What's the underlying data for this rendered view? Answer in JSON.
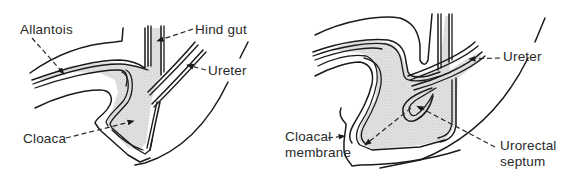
{
  "figure": {
    "panels": [
      {
        "id": "left",
        "description": "Early stage: cloaca with allantois, hind gut and ureter",
        "labels": [
          {
            "key": "allantois",
            "text": "Allantois"
          },
          {
            "key": "hind_gut",
            "text": "Hind gut"
          },
          {
            "key": "ureter",
            "text": "Ureter"
          },
          {
            "key": "cloaca",
            "text": "Cloaca"
          }
        ]
      },
      {
        "id": "right",
        "description": "Later stage: urorectal septum dividing cloaca",
        "labels": [
          {
            "key": "ureter",
            "text": "Ureter"
          },
          {
            "key": "cloacal_membrane_1",
            "text": "Cloacal"
          },
          {
            "key": "cloacal_membrane_2",
            "text": "membrane"
          },
          {
            "key": "urorectal_septum_1",
            "text": "Urorectal"
          },
          {
            "key": "urorectal_septum_2",
            "text": "septum"
          }
        ]
      }
    ],
    "colors": {
      "line": "#1a1a1a",
      "fill_shade": "#d9d9d9",
      "background": "#ffffff",
      "text": "#2a2a2a"
    }
  }
}
